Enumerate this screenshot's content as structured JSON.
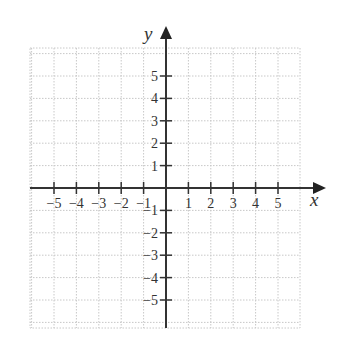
{
  "chart_data": {
    "type": "coordinate-plane",
    "title": "",
    "xlabel": "x",
    "ylabel": "y",
    "xlim": [
      -6,
      6
    ],
    "ylim": [
      -6,
      6
    ],
    "grid": true,
    "grid_style": "dotted",
    "x_ticks": [
      -5,
      -4,
      -3,
      -2,
      -1,
      1,
      2,
      3,
      4,
      5
    ],
    "y_ticks": [
      5,
      4,
      3,
      2,
      1,
      -1,
      -2,
      -3,
      -4,
      -5
    ],
    "x_tick_labels": [
      "−5",
      "−4",
      "−3",
      "−2",
      "−1",
      "1",
      "2",
      "3",
      "4",
      "5"
    ],
    "y_tick_labels": [
      "5",
      "4",
      "3",
      "2",
      "1",
      "−1",
      "−2",
      "−3",
      "−4",
      "−5"
    ],
    "data_points": []
  },
  "axes": {
    "x_label": "x",
    "y_label": "y",
    "color": "#333333",
    "grid_color": "#c8c8c8"
  }
}
